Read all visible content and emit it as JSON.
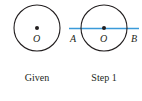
{
  "figures": [
    {
      "caption": "Given",
      "center_label": "O"
    },
    {
      "caption": "Step 1",
      "center_label": "O",
      "endpoint_left": "A",
      "endpoint_right": "B"
    }
  ],
  "colors": {
    "stroke": "#231f20",
    "diameter_line": "#3a9ad9"
  }
}
